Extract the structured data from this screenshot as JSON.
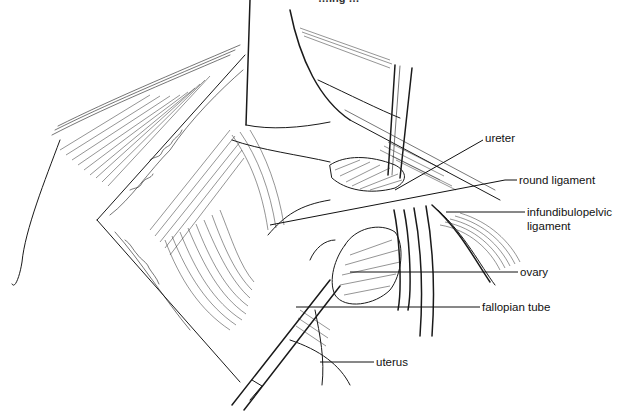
{
  "figure": {
    "type": "surgical illustration",
    "caption_partial": "…ing …",
    "labels": [
      {
        "id": "ureter",
        "text": "ureter"
      },
      {
        "id": "round-ligament",
        "text": "round ligament"
      },
      {
        "id": "infundibulopelvic-ligament",
        "text": "infundibulopelvic ligament",
        "line1": "infundibulopelvic",
        "line2": "ligament"
      },
      {
        "id": "ovary",
        "text": "ovary"
      },
      {
        "id": "fallopian-tube",
        "text": "fallopian tube"
      },
      {
        "id": "uterus",
        "text": "uterus"
      }
    ]
  }
}
